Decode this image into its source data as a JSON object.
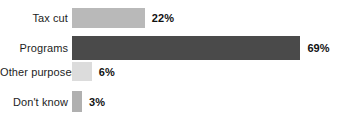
{
  "chart_data": {
    "type": "bar",
    "orientation": "horizontal",
    "title": "",
    "subtitle": "",
    "xlabel": "",
    "ylabel": "",
    "xlim": [
      0,
      100
    ],
    "grid": false,
    "legend": null,
    "value_suffix": "%",
    "categories": [
      "Tax cut",
      "Programs",
      "Other purposes",
      "Don't know"
    ],
    "values": [
      22,
      69,
      6,
      3
    ],
    "value_labels": [
      "22%",
      "69%",
      "6%",
      "3%"
    ],
    "bar_colors": [
      "#b9b9b9",
      "#4a4a4a",
      "#dcdcdc",
      "#b0b0b0"
    ],
    "bars": [
      {
        "label": "Tax cut",
        "value": 22,
        "value_label": "22%",
        "color": "#b9b9b9",
        "top": 8,
        "height": 20
      },
      {
        "label": "Programs",
        "value": 69,
        "value_label": "69%",
        "color": "#4a4a4a",
        "top": 36,
        "height": 24
      },
      {
        "label": "Other purposes",
        "value": 6,
        "value_label": "6%",
        "color": "#dcdcdc",
        "top": 62,
        "height": 19
      },
      {
        "label": "Don't know",
        "value": 3,
        "value_label": "3%",
        "color": "#b0b0b0",
        "top": 91,
        "height": 21
      }
    ]
  },
  "style": {
    "background": "#ffffff",
    "label_color": "#1d1d1d",
    "value_color": "#111111",
    "px_per_percent": 3.31,
    "bar_origin_x": 76
  }
}
